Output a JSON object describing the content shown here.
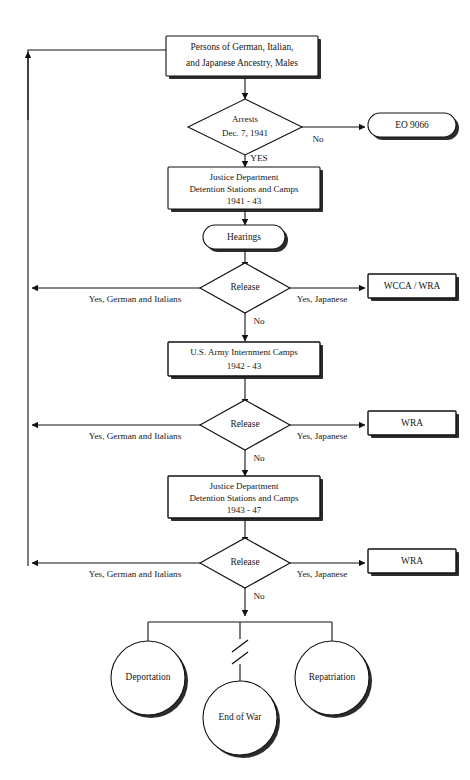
{
  "diagram": {
    "background_color": "#ffffff",
    "line_color": "#111111",
    "text_color": "#161616"
  },
  "nodes": {
    "origin": {
      "shape": "rectangle",
      "lines": [
        "Persons of German, Italian,",
        "and Japanese Ancestry, Males"
      ]
    },
    "arrests": {
      "shape": "diamond",
      "lines": [
        "Arrests",
        "Dec. 7, 1941"
      ]
    },
    "eo9066": {
      "shape": "stadium",
      "lines": [
        "EO  9066"
      ]
    },
    "justice1": {
      "shape": "rectangle",
      "lines": [
        "Justice Department",
        "Detention Stations and Camps",
        "1941 - 43"
      ]
    },
    "hearings": {
      "shape": "stadium",
      "lines": [
        "Hearings"
      ]
    },
    "release1": {
      "shape": "diamond",
      "lines": [
        "Release"
      ]
    },
    "wcca_wra": {
      "shape": "rectangle",
      "lines": [
        "WCCA / WRA"
      ]
    },
    "army": {
      "shape": "rectangle",
      "lines": [
        "U.S. Army Internment Camps",
        "1942 - 43"
      ]
    },
    "release2": {
      "shape": "diamond",
      "lines": [
        "Release"
      ]
    },
    "wra2": {
      "shape": "rectangle",
      "lines": [
        "WRA"
      ]
    },
    "justice2": {
      "shape": "rectangle",
      "lines": [
        "Justice Department",
        "Detention Stations and Camps",
        "1943 - 47"
      ]
    },
    "release3": {
      "shape": "diamond",
      "lines": [
        "Release"
      ]
    },
    "wra3": {
      "shape": "rectangle",
      "lines": [
        "WRA"
      ]
    },
    "deportation": {
      "shape": "circle",
      "lines": [
        "Deportation"
      ]
    },
    "end_of_war": {
      "shape": "circle",
      "lines": [
        "End of War"
      ]
    },
    "repatriation": {
      "shape": "circle",
      "lines": [
        "Repatriation"
      ]
    }
  },
  "edge_labels": {
    "arrests_no": "No",
    "arrests_yes": "YES",
    "release1_left": "Yes,  German and Italians",
    "release1_right": "Yes,  Japanese",
    "release1_down": "No",
    "release2_left": "Yes,  German and Italians",
    "release2_right": "Yes,  Japanese",
    "release2_down": "No",
    "release3_left": "Yes,  German and Italians",
    "release3_right": "Yes,  Japanese",
    "release3_down": "No"
  }
}
